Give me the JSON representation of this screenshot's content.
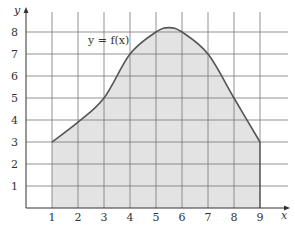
{
  "chart_data": {
    "type": "area",
    "title": "",
    "xlabel": "x",
    "ylabel": "y",
    "annotation": "y = f(x)",
    "x": [
      1,
      2,
      3,
      4,
      5,
      5.5,
      6,
      7,
      8,
      9
    ],
    "series": [
      {
        "name": "f(x)",
        "values": [
          3,
          3.9,
          5,
          7,
          8,
          8.2,
          8,
          7,
          5,
          3
        ]
      }
    ],
    "shaded_region": {
      "from_x": 1,
      "to_x": 9,
      "to_y": 0
    },
    "xticks": [
      "1",
      "2",
      "3",
      "4",
      "5",
      "6",
      "7",
      "8",
      "9"
    ],
    "yticks": [
      "1",
      "2",
      "3",
      "4",
      "5",
      "6",
      "7",
      "8"
    ],
    "xlim": [
      0,
      9.7
    ],
    "ylim": [
      0,
      8.7
    ],
    "grid": true,
    "legend": "none",
    "colors": {
      "curve": "#555555",
      "fill": "#e3e3e3",
      "grid": "#777777",
      "axis": "#333333"
    }
  }
}
